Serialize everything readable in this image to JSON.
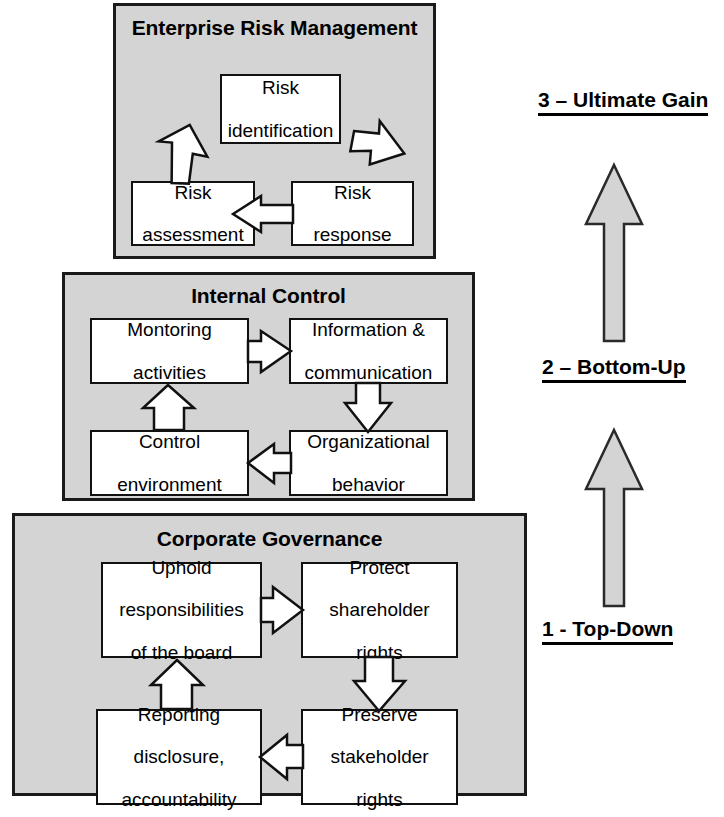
{
  "diagram": {
    "background_color": "#ffffff",
    "panel_fill": "#d4d4d4",
    "node_fill": "#ffffff",
    "line_color": "#111111",
    "big_arrow_fill": "#d4d4d4"
  },
  "panels": [
    {
      "id": "erm",
      "title": "Enterprise Risk Management",
      "title_line1": "Enterprise Risk",
      "title_line2": "Management",
      "nodes": [
        {
          "id": "risk-identification",
          "line1": "Risk",
          "line2": "identification"
        },
        {
          "id": "risk-assessment",
          "line1": "Risk",
          "line2": "assessment"
        },
        {
          "id": "risk-response",
          "line1": "Risk",
          "line2": "response"
        }
      ],
      "flow": [
        "Risk assessment → Risk identification",
        "Risk identification → Risk response",
        "Risk response → Risk assessment"
      ]
    },
    {
      "id": "internal-control",
      "title": "Internal Control",
      "title_line1": "Internal Control",
      "title_line2": "",
      "nodes": [
        {
          "id": "monitoring-activities",
          "line1": "Montoring",
          "line2": "activities"
        },
        {
          "id": "information-communication",
          "line1": "Information &",
          "line2": "communication"
        },
        {
          "id": "control-environment",
          "line1": "Control",
          "line2": "environment"
        },
        {
          "id": "organizational-behavior",
          "line1": "Organizational",
          "line2": "behavior"
        }
      ],
      "flow": [
        "Montoring activities → Information & communication",
        "Information & communication → Organizational behavior",
        "Organizational behavior → Control environment",
        "Control environment → Montoring activities"
      ]
    },
    {
      "id": "corporate-governance",
      "title": "Corporate Governance",
      "title_line1": "Corporate Governance",
      "title_line2": "",
      "nodes": [
        {
          "id": "uphold-responsibilities",
          "line1": "Uphold",
          "line2": "responsibilities",
          "line3": "of the board"
        },
        {
          "id": "protect-shareholder-rights",
          "line1": "Protect",
          "line2": "shareholder",
          "line3": "rights"
        },
        {
          "id": "reporting-disclosure",
          "line1": "Reporting",
          "line2": "disclosure,",
          "line3": "accountability"
        },
        {
          "id": "preserve-stakeholder-rights",
          "line1": "Preserve",
          "line2": "stakeholder",
          "line3": "rights"
        }
      ],
      "flow": [
        "Uphold responsibilities of the board → Protect shareholder rights",
        "Protect shareholder rights → Preserve stakeholder rights",
        "Preserve stakeholder rights → Reporting disclosure, accountability",
        "Reporting disclosure, accountability → Uphold responsibilities of the board"
      ]
    }
  ],
  "stages": [
    {
      "id": "stage-3",
      "label": "3 – Ultimate Gain"
    },
    {
      "id": "stage-2",
      "label": "2 – Bottom-Up"
    },
    {
      "id": "stage-1",
      "label": "1 - Top-Down"
    }
  ],
  "progression_arrows": [
    {
      "id": "arrow-to-ultimate-gain",
      "direction": "up"
    },
    {
      "id": "arrow-to-bottom-up",
      "direction": "up"
    }
  ]
}
